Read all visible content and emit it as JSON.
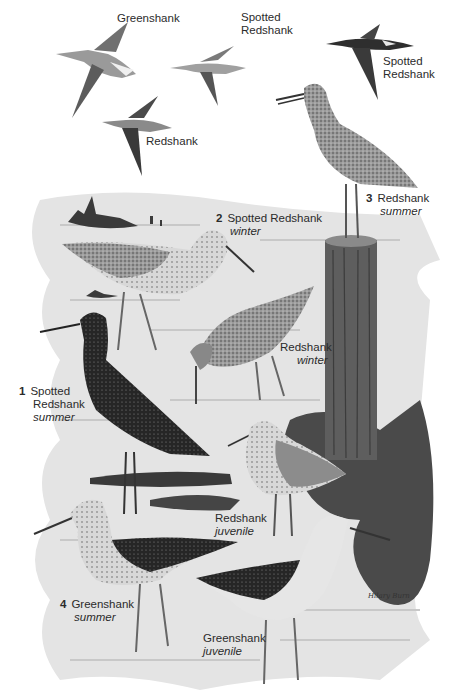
{
  "plate": {
    "background": "#ffffff",
    "water_color": "#d9d9d9",
    "mud_color": "#3f3f3f",
    "post_color": "#5a5a5a"
  },
  "flight_labels": [
    {
      "name": "Greenshank"
    },
    {
      "name": "Spotted",
      "name2": "Redshank"
    },
    {
      "name": "Redshank"
    },
    {
      "name": "Spotted",
      "name2": "Redshank"
    }
  ],
  "birds": [
    {
      "number": "1",
      "name": "Spotted",
      "name2": "Redshank",
      "season": "summer"
    },
    {
      "number": "2",
      "name": "Spotted Redshank",
      "season": "winter"
    },
    {
      "number": "3",
      "name": "Redshank",
      "season": "summer"
    },
    {
      "number": "4",
      "name": "Greenshank",
      "season": "summer"
    }
  ],
  "unnumbered": [
    {
      "name": "Redshank",
      "season": "winter"
    },
    {
      "name": "Redshank",
      "season": "juvenile"
    },
    {
      "name": "Greenshank",
      "season": "juvenile"
    }
  ],
  "signature": "Hilary Burn"
}
